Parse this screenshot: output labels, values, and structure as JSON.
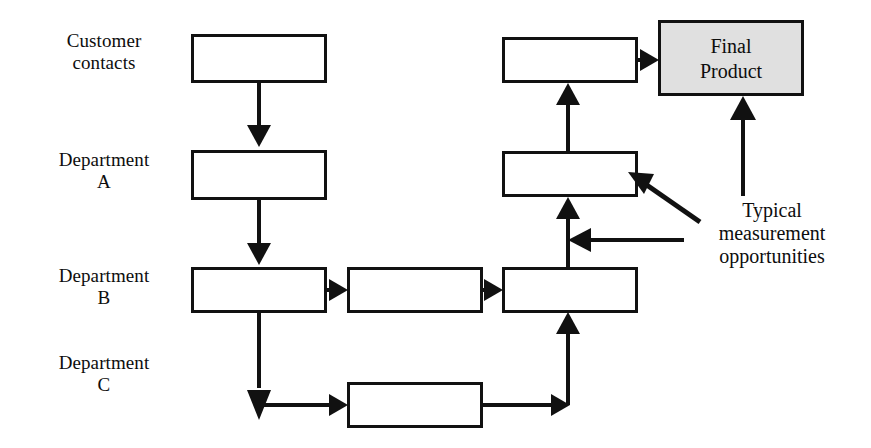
{
  "diagram": {
    "type": "process-flow-diagram",
    "background_color": "#ffffff",
    "line_color": "#111111",
    "shaded_fill_color": "#e0e0e0",
    "row_labels": [
      {
        "id": "customer-contacts",
        "text": "Customer\ncontacts"
      },
      {
        "id": "department-a",
        "text": "Department\nA"
      },
      {
        "id": "department-b",
        "text": "Department\nB"
      },
      {
        "id": "department-c",
        "text": "Department\nC"
      }
    ],
    "boxes": [
      {
        "id": "box-customer-contacts",
        "label": "",
        "row": "customer-contacts",
        "column": "left",
        "shaded": false
      },
      {
        "id": "box-dept-a-left",
        "label": "",
        "row": "department-a",
        "column": "left",
        "shaded": false
      },
      {
        "id": "box-dept-b-left",
        "label": "",
        "row": "department-b",
        "column": "left",
        "shaded": false
      },
      {
        "id": "box-dept-b-middle",
        "label": "",
        "row": "department-b",
        "column": "middle",
        "shaded": false
      },
      {
        "id": "box-dept-b-right",
        "label": "",
        "row": "department-b",
        "column": "right",
        "shaded": false
      },
      {
        "id": "box-dept-a-right",
        "label": "",
        "row": "department-a",
        "column": "right",
        "shaded": false
      },
      {
        "id": "box-customer-contacts-right",
        "label": "",
        "row": "customer-contacts",
        "column": "right",
        "shaded": false
      },
      {
        "id": "box-dept-c-middle",
        "label": "",
        "row": "department-c",
        "column": "middle",
        "shaded": false
      },
      {
        "id": "box-final-product",
        "label": "Final\nProduct",
        "row": "customer-contacts",
        "column": "far-right",
        "shaded": true
      }
    ],
    "flow_connections": [
      {
        "from": "box-customer-contacts",
        "to": "box-dept-a-left",
        "direction": "down"
      },
      {
        "from": "box-dept-a-left",
        "to": "box-dept-b-left",
        "direction": "down"
      },
      {
        "from": "box-dept-b-left",
        "to": "box-dept-b-middle",
        "direction": "right"
      },
      {
        "from": "box-dept-b-middle",
        "to": "box-dept-b-right",
        "direction": "right"
      },
      {
        "from": "box-dept-b-left",
        "to": "box-dept-c-middle",
        "direction": "down-then-right"
      },
      {
        "from": "box-dept-c-middle",
        "to": "box-dept-b-right",
        "direction": "right-then-up"
      },
      {
        "from": "box-dept-b-right",
        "to": "box-dept-a-right",
        "direction": "up"
      },
      {
        "from": "box-dept-a-right",
        "to": "box-customer-contacts-right",
        "direction": "up"
      },
      {
        "from": "box-customer-contacts-right",
        "to": "box-final-product",
        "direction": "right"
      }
    ],
    "annotations": [
      {
        "id": "typical-measurement-opportunities",
        "text": "Typical\nmeasurement\nopportunities",
        "pointer_targets": [
          "box-final-product",
          "box-dept-a-right",
          "flow-dept-c-to-dept-b-right"
        ]
      }
    ]
  }
}
